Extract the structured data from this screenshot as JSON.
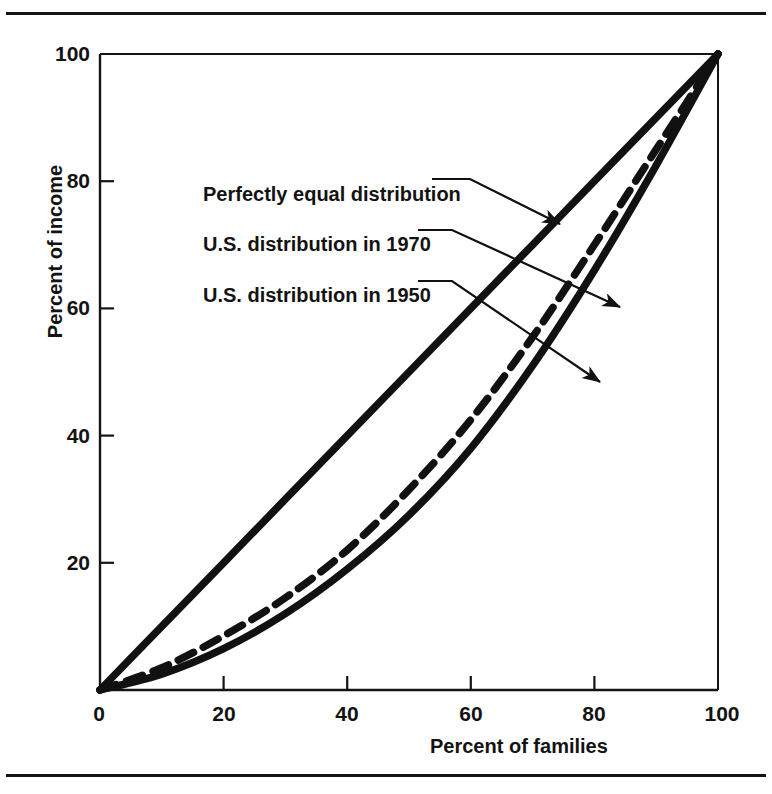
{
  "figure": {
    "has_top_rule": true,
    "has_bottom_rule": true,
    "frame_color": "#141414"
  },
  "chart_data": {
    "type": "line",
    "title": "",
    "subtitle": "",
    "xlabel": "Percent of families",
    "ylabel": "Percent of income",
    "xlim": [
      0,
      100
    ],
    "ylim": [
      0,
      100
    ],
    "xticks": [
      0,
      20,
      40,
      60,
      80,
      100
    ],
    "yticks": [
      0,
      20,
      40,
      60,
      80,
      100
    ],
    "xtick_labels": [
      "0",
      "20",
      "40",
      "60",
      "80",
      "100"
    ],
    "ytick_labels": [
      "0",
      "20",
      "40",
      "60",
      "80",
      "100"
    ],
    "grid": false,
    "legend": "none (direct annotations with leader lines)",
    "line_color": "#111111",
    "series": [
      {
        "name": "Perfectly equal distribution",
        "style": "solid",
        "x": [
          0,
          10,
          20,
          30,
          40,
          50,
          60,
          70,
          80,
          90,
          100
        ],
        "values": [
          0,
          10,
          20,
          30,
          40,
          50,
          60,
          70,
          80,
          90,
          100
        ]
      },
      {
        "name": "U.S. distribution in 1970",
        "style": "dashed",
        "x": [
          0,
          10,
          20,
          30,
          40,
          50,
          60,
          70,
          80,
          90,
          100
        ],
        "values": [
          0,
          3.5,
          8.5,
          14.5,
          22,
          31.5,
          42.5,
          55.5,
          70,
          85,
          100
        ]
      },
      {
        "name": "U.S. distribution in 1950",
        "style": "solid",
        "x": [
          0,
          10,
          20,
          30,
          40,
          50,
          60,
          70,
          80,
          90,
          100
        ],
        "values": [
          0,
          2.5,
          6.5,
          12,
          19,
          27.5,
          38,
          51,
          66,
          82.5,
          100
        ]
      }
    ],
    "annotations": [
      {
        "text": "Perfectly equal distribution",
        "target_series": "Perfectly equal distribution",
        "target_x": 70,
        "target_y": 70
      },
      {
        "text": "U.S. distribution in 1970",
        "target_series": "U.S. distribution in 1970",
        "target_x": 80,
        "target_y": 70
      },
      {
        "text": "U.S. distribution in 1950",
        "target_series": "U.S. distribution in 1950",
        "target_x": 75,
        "target_y": 58
      }
    ]
  }
}
